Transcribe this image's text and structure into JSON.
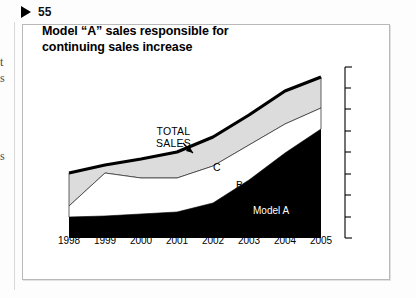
{
  "page": {
    "marker_icon": "play-triangle-icon",
    "page_number": "55",
    "margin_fragments": [
      "t",
      "s",
      "s"
    ]
  },
  "figure": {
    "title": "Model “A” sales responsible for continuing sales increase",
    "annotations": {
      "total_sales": "TOTAL\nSALES",
      "total_sales_line1": "TOTAL",
      "total_sales_line2": "SALES",
      "band_c": "C",
      "band_b": "B",
      "band_a": "Model A"
    }
  },
  "chart_data": {
    "type": "area",
    "title": "Model “A” sales responsible for continuing sales increase",
    "xlabel": "",
    "ylabel": "",
    "grid": false,
    "legend": "in-plot labels",
    "stacked": true,
    "axis_right": {
      "visible": true,
      "labels": [],
      "tick_count": 9,
      "style": "bracket"
    },
    "categories": [
      "1998",
      "1999",
      "2000",
      "2001",
      "2002",
      "2003",
      "2004",
      "2005"
    ],
    "series": [
      {
        "name": "Model A",
        "color": "#000000",
        "values": [
          21,
          22,
          24,
          27,
          33,
          55,
          80,
          109
        ]
      },
      {
        "name": "B",
        "color": "#ffffff",
        "values": [
          11,
          17,
          16,
          16,
          25,
          27,
          25,
          21
        ]
      },
      {
        "name": "C",
        "color": "#dcdcdc",
        "values": [
          33,
          32,
          34,
          36,
          33,
          32,
          32,
          31
        ]
      }
    ],
    "totals": [
      65,
      71,
      74,
      79,
      91,
      114,
      137,
      161
    ],
    "total_line": {
      "name": "TOTAL SALES",
      "color": "#000000",
      "width": 3
    },
    "ylim": [
      0,
      175
    ]
  }
}
